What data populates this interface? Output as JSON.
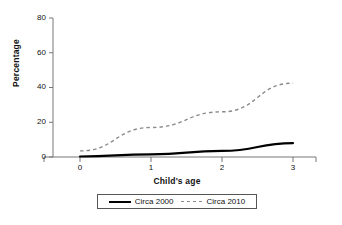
{
  "chart_data": {
    "type": "line",
    "title": "",
    "subtitle": "",
    "xlabel": "Child's age",
    "ylabel": "Percentage",
    "x": [
      0,
      1,
      2,
      3
    ],
    "xlim": [
      -0.35,
      3.45
    ],
    "ylim": [
      0,
      80
    ],
    "xticks": [
      "0",
      "1",
      "2",
      "3"
    ],
    "yticks": [
      "0",
      "20",
      "40",
      "60",
      "80"
    ],
    "grid": false,
    "legend_position": "bottom",
    "series": [
      {
        "name": "Circa 2000",
        "values": [
          0.3,
          1.5,
          3.5,
          8.0
        ],
        "style": "solid",
        "color": "#000000"
      },
      {
        "name": "Circa 2010",
        "values": [
          3.5,
          17.0,
          26.0,
          42.5
        ],
        "style": "dashed",
        "color": "#8a8a8a"
      }
    ]
  },
  "axes": {
    "y_title": "Percentage",
    "x_title": "Child's age",
    "y_ticks": [
      "80",
      "60",
      "40",
      "20",
      "0"
    ],
    "x_ticks": [
      "0",
      "1",
      "2",
      "3"
    ]
  },
  "legend": {
    "items": [
      {
        "label": "Circa 2000",
        "style": "solid"
      },
      {
        "label": "Circa 2010",
        "style": "dashed"
      }
    ]
  },
  "colors": {
    "series_solid": "#000000",
    "series_dashed": "#8a8a8a",
    "axis": "#666666",
    "text": "#111111"
  }
}
